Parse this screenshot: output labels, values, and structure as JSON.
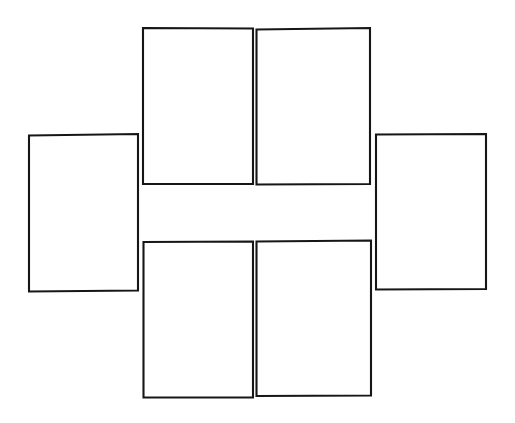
{
  "canvas": {
    "width": 515,
    "height": 423,
    "background_color": "#ffffff",
    "stroke_color": "#161616",
    "fill_color": "#ffffff",
    "stroke_width": 2.1,
    "title": "Cube net outline diagram"
  },
  "diagram": {
    "kind": "cube-net",
    "arrangement": "cross",
    "panel_count": 6,
    "panels": [
      {
        "name": "top-left-panel",
        "label": "",
        "points": "143,28 253,28.5 253,184 143,184"
      },
      {
        "name": "top-right-panel",
        "label": "",
        "points": "256.5,29.5 370,28 370,184 256.5,184.5"
      },
      {
        "name": "left-panel",
        "label": "",
        "points": "29,135.5 138,134 138,290.5 29,291.5"
      },
      {
        "name": "right-panel",
        "label": "",
        "points": "376,134.5 486,134 486,289 376,289.5"
      },
      {
        "name": "bottom-left-panel",
        "label": "",
        "points": "143.5,242 253,241.5 253,397.5 143.5,397.5"
      },
      {
        "name": "bottom-right-panel",
        "label": "",
        "points": "256.5,241.5 371,240.5 371,395.5 256.5,396"
      }
    ]
  }
}
